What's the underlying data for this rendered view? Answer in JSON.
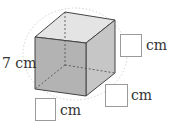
{
  "diagram": {
    "type": "cube",
    "colors": {
      "front_face": "#b3b3b3",
      "top_face": "#e4e4e4",
      "side_face": "#c6c6c6",
      "edge": "#444444",
      "hidden_edge": "#555555",
      "circle": "#c8c8c8"
    },
    "given_edge": {
      "value": "7",
      "unit": "cm",
      "text": "7 cm"
    },
    "blanks": [
      {
        "id": "right-top",
        "unit": "cm",
        "value": ""
      },
      {
        "id": "right-bottom",
        "unit": "cm",
        "value": ""
      },
      {
        "id": "bottom-left",
        "unit": "cm",
        "value": ""
      }
    ]
  }
}
